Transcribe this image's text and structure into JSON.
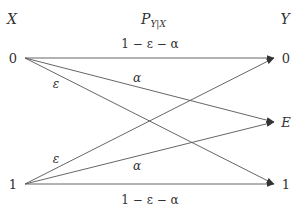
{
  "diagram": {
    "type": "channel-transition-diagram",
    "header": {
      "input_label": "X",
      "channel_label_main": "P",
      "channel_label_sub": "Y|X",
      "output_label": "Y"
    },
    "inputs": [
      {
        "id": "x0",
        "label": "0"
      },
      {
        "id": "x1",
        "label": "1"
      }
    ],
    "outputs": [
      {
        "id": "y0",
        "label": "0"
      },
      {
        "id": "yE",
        "label": "E"
      },
      {
        "id": "y1",
        "label": "1"
      }
    ],
    "edges": [
      {
        "from": "x0",
        "to": "y0",
        "label": "1 − ε − α"
      },
      {
        "from": "x0",
        "to": "yE",
        "label": "α"
      },
      {
        "from": "x0",
        "to": "y1",
        "label": "ε"
      },
      {
        "from": "x1",
        "to": "y0",
        "label": "ε"
      },
      {
        "from": "x1",
        "to": "yE",
        "label": "α"
      },
      {
        "from": "x1",
        "to": "y1",
        "label": "1 − ε − α"
      }
    ],
    "colors": {
      "line": "#555555",
      "text": "#333333",
      "background": "#ffffff"
    }
  }
}
